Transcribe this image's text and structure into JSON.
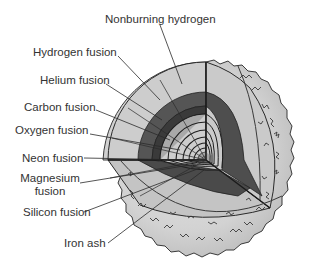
{
  "diagram": {
    "labels": [
      {
        "id": "nonburning-hydrogen",
        "text": "Nonburning hydrogen"
      },
      {
        "id": "hydrogen-fusion",
        "text": "Hydrogen fusion"
      },
      {
        "id": "helium-fusion",
        "text": "Helium fusion"
      },
      {
        "id": "carbon-fusion",
        "text": "Carbon fusion"
      },
      {
        "id": "oxygen-fusion",
        "text": "Oxygen fusion"
      },
      {
        "id": "neon-fusion",
        "text": "Neon fusion"
      },
      {
        "id": "magnesium-fusion",
        "text": "Magnesium\nfusion",
        "line1": "Magnesium",
        "line2": "fusion"
      },
      {
        "id": "silicon-fusion",
        "text": "Silicon fusion"
      },
      {
        "id": "iron-ash",
        "text": "Iron ash"
      }
    ],
    "colors": {
      "outer_surface": "#d4d4d4",
      "outer_shell_light": "#c8c8c8",
      "hydrogen_fusion_band": "#5a5a5a",
      "helium_fusion_band": "#3c3c3c",
      "inner_shells": "#a8a8a8",
      "core": "#8a8a8a",
      "lines": "#2a2a2a",
      "label_text": "#333333"
    }
  }
}
